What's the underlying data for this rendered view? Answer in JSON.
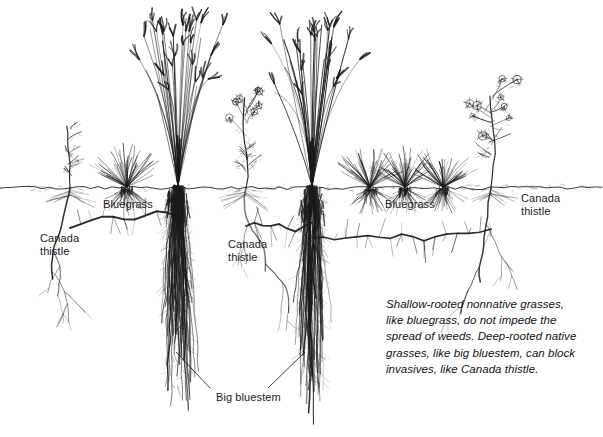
{
  "figure": {
    "width": 603,
    "height": 437,
    "background": "#ffffff",
    "ink_color": "#1a1a1a",
    "soil_line_y": 188
  },
  "labels": [
    {
      "id": "canada-thistle-left",
      "text": "Canada\nthistle",
      "x": 40,
      "y": 232
    },
    {
      "id": "bluegrass-left",
      "text": "Bluegrass",
      "x": 103,
      "y": 198
    },
    {
      "id": "canada-thistle-mid",
      "text": "Canada\nthistle",
      "x": 228,
      "y": 238
    },
    {
      "id": "bluegrass-right",
      "text": "Bluegrass",
      "x": 385,
      "y": 198
    },
    {
      "id": "canada-thistle-right",
      "text": "Canada\nthistle",
      "x": 521,
      "y": 192
    },
    {
      "id": "big-bluestem",
      "text": "Big bluestem",
      "x": 216,
      "y": 391
    }
  ],
  "caption": {
    "text": "Shallow-rooted nonnative grasses, like bluegrass, do not impede the spread of weeds. Deep-rooted native grasses, like big bluestem, can block invasives, like Canada thistle.",
    "x": 386,
    "y": 296
  },
  "plants": [
    {
      "id": "thistle-1",
      "species": "Canada thistle",
      "type": "thistle",
      "x": 70,
      "root_depth": 110,
      "canopy_height": 62,
      "flowering": false
    },
    {
      "id": "bluegrass-1",
      "species": "Bluegrass",
      "type": "bluegrass",
      "x": 127,
      "root_depth": 22,
      "canopy_height": 40,
      "flowering": false
    },
    {
      "id": "bluestem-1",
      "species": "Big bluestem",
      "type": "big-bluestem",
      "x": 178,
      "root_depth": 240,
      "canopy_height": 160,
      "flowering": true
    },
    {
      "id": "thistle-2",
      "species": "Canada thistle",
      "type": "thistle",
      "x": 246,
      "root_depth": 104,
      "canopy_height": 90,
      "flowering": true
    },
    {
      "id": "bluestem-2",
      "species": "Big bluestem",
      "type": "big-bluestem",
      "x": 312,
      "root_depth": 244,
      "canopy_height": 162,
      "flowering": true
    },
    {
      "id": "bluegrass-2",
      "species": "Bluegrass",
      "type": "bluegrass",
      "x": 370,
      "root_depth": 22,
      "canopy_height": 38,
      "flowering": false
    },
    {
      "id": "bluegrass-3",
      "species": "Bluegrass",
      "type": "bluegrass",
      "x": 405,
      "root_depth": 22,
      "canopy_height": 38,
      "flowering": false
    },
    {
      "id": "bluegrass-4",
      "species": "Bluegrass",
      "type": "bluegrass",
      "x": 443,
      "root_depth": 22,
      "canopy_height": 38,
      "flowering": false
    },
    {
      "id": "thistle-3",
      "species": "Canada thistle",
      "type": "thistle",
      "x": 491,
      "root_depth": 112,
      "canopy_height": 92,
      "flowering": true
    }
  ],
  "rhizomes": [
    {
      "id": "rhizome-left",
      "from_x": 70,
      "to_x": 178,
      "depth": 228
    },
    {
      "id": "rhizome-mid",
      "from_x": 246,
      "to_x": 312,
      "depth": 226
    },
    {
      "id": "rhizome-right",
      "from_x": 312,
      "to_x": 491,
      "depth": 238
    }
  ],
  "leaders": [
    {
      "id": "leader-bluestem-left",
      "x1": 210,
      "y1": 388,
      "x2": 176,
      "y2": 352
    },
    {
      "id": "leader-bluestem-right",
      "x1": 268,
      "y1": 388,
      "x2": 305,
      "y2": 352
    }
  ]
}
